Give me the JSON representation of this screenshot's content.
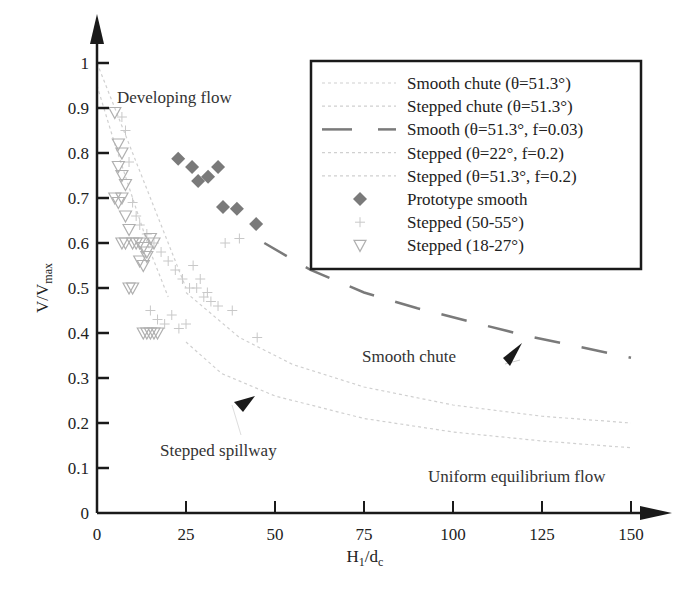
{
  "chart_data": {
    "type": "scatter",
    "title": "",
    "xlabel": "H1/dc",
    "xlabel_main": "H",
    "xlabel_sub1": "1",
    "xlabel_slash": "/d",
    "xlabel_sub2": "c",
    "ylabel": "V/Vmax",
    "ylabel_main": "V/V",
    "ylabel_sub": "max",
    "xlim": [
      0,
      150
    ],
    "ylim": [
      0,
      1
    ],
    "grid": false,
    "legend_position": "upper right",
    "x_ticks": [
      "0",
      "25",
      "50",
      "75",
      "100",
      "125",
      "150"
    ],
    "y_ticks": [
      "0",
      "0.1",
      "0.2",
      "0.3",
      "0.4",
      "0.5",
      "0.6",
      "0.7",
      "0.8",
      "0.9",
      "1"
    ],
    "annotations": [
      {
        "text": "Developing flow",
        "x": 6,
        "y": 0.97
      },
      {
        "text": "Smooth chute",
        "x": 68,
        "y": 0.37,
        "arrow_to": [
          120,
          0.39
        ]
      },
      {
        "text": "Stepped spillway",
        "x": 18,
        "y": 0.14,
        "arrow_to": [
          45,
          0.27
        ]
      },
      {
        "text": "Uniform equilibrium flow",
        "x": 92,
        "y": 0.05
      }
    ],
    "series": [
      {
        "name": "Smooth chute (θ=51.3°)",
        "type": "line",
        "style": "dotted",
        "x": [
          0,
          5,
          10,
          15,
          20,
          25
        ],
        "y": [
          1.0,
          0.9,
          0.8,
          0.7,
          0.6,
          0.5
        ]
      },
      {
        "name": "Stepped chute (θ=51.3°)",
        "type": "line",
        "style": "dotted",
        "x": [
          0,
          5,
          10,
          15,
          20
        ],
        "y": [
          0.95,
          0.82,
          0.7,
          0.58,
          0.48
        ]
      },
      {
        "name": "Smooth (θ=51.3°, f=0.03)",
        "type": "line",
        "style": "dashed",
        "x": [
          47,
          60,
          75,
          90,
          105,
          120,
          135,
          150
        ],
        "y": [
          0.6,
          0.54,
          0.49,
          0.455,
          0.425,
          0.395,
          0.37,
          0.345
        ]
      },
      {
        "name": "Stepped (θ=22°, f=0.2)",
        "type": "line",
        "style": "dotted",
        "x": [
          25,
          40,
          55,
          75,
          100,
          125,
          150
        ],
        "y": [
          0.49,
          0.39,
          0.33,
          0.28,
          0.24,
          0.215,
          0.2
        ]
      },
      {
        "name": "Stepped (θ=51.3°, f=0.2)",
        "type": "line",
        "style": "dotted",
        "x": [
          25,
          35,
          50,
          75,
          100,
          125,
          150
        ],
        "y": [
          0.38,
          0.31,
          0.26,
          0.21,
          0.18,
          0.16,
          0.145
        ]
      },
      {
        "name": "Prototype smooth",
        "type": "scatter",
        "marker": "diamond",
        "x": [
          22.8,
          26.7,
          28.4,
          31.2,
          34.0,
          35.4,
          39.3,
          44.7
        ],
        "y": [
          0.787,
          0.769,
          0.738,
          0.747,
          0.769,
          0.68,
          0.676,
          0.642
        ]
      },
      {
        "name": "Stepped (50-55°)",
        "type": "scatter",
        "marker": "plus",
        "x": [
          7,
          8,
          9,
          10,
          11,
          12,
          14,
          16,
          18,
          20,
          22,
          24,
          26,
          28,
          30,
          32,
          34,
          36,
          38,
          40,
          45,
          15,
          17,
          19,
          21,
          23,
          25,
          27,
          29,
          31
        ],
        "y": [
          0.88,
          0.85,
          0.78,
          0.69,
          0.66,
          0.64,
          0.62,
          0.6,
          0.58,
          0.56,
          0.54,
          0.52,
          0.5,
          0.5,
          0.48,
          0.47,
          0.46,
          0.6,
          0.45,
          0.61,
          0.39,
          0.45,
          0.43,
          0.42,
          0.44,
          0.41,
          0.42,
          0.55,
          0.52,
          0.49
        ]
      },
      {
        "name": "Stepped (18-27°)",
        "type": "scatter",
        "marker": "triangle-down",
        "x": [
          5,
          6,
          7,
          6,
          7,
          8,
          5,
          6,
          7,
          8,
          9,
          10,
          11,
          12,
          13,
          14,
          15,
          16,
          7,
          8,
          9,
          10,
          13,
          14,
          15,
          16,
          17,
          12,
          13,
          14
        ],
        "y": [
          0.89,
          0.82,
          0.8,
          0.77,
          0.75,
          0.73,
          0.7,
          0.69,
          0.7,
          0.66,
          0.63,
          0.6,
          0.6,
          0.6,
          0.59,
          0.58,
          0.61,
          0.6,
          0.6,
          0.6,
          0.5,
          0.5,
          0.4,
          0.4,
          0.4,
          0.4,
          0.4,
          0.56,
          0.55,
          0.57
        ]
      }
    ],
    "legend": [
      {
        "label": "Smooth chute (θ=51.3°)",
        "symbol": "dotted-line"
      },
      {
        "label": "Stepped chute (θ=51.3°)",
        "symbol": "dotted-line"
      },
      {
        "label": "Smooth (θ=51.3°, f=0.03)",
        "symbol": "dashed-line"
      },
      {
        "label": "Stepped (θ=22°, f=0.2)",
        "symbol": "dotted-line"
      },
      {
        "label": "Stepped (θ=51.3°, f=0.2)",
        "symbol": "dotted-line"
      },
      {
        "label": "Prototype smooth",
        "symbol": "diamond"
      },
      {
        "label": "Stepped (50-55°)",
        "symbol": "plus"
      },
      {
        "label": "Stepped (18-27°)",
        "symbol": "triangle-down"
      }
    ]
  },
  "colors": {
    "axis": "#1a1a1a",
    "dashed_line": "#7a7a7a",
    "diamond": "#7a7a7a",
    "light_line": "#d0d0d0",
    "plus_marker": "#c8c8c8",
    "triangle_marker": "#b0b0b0",
    "legend_border": "#1a1a1a"
  }
}
